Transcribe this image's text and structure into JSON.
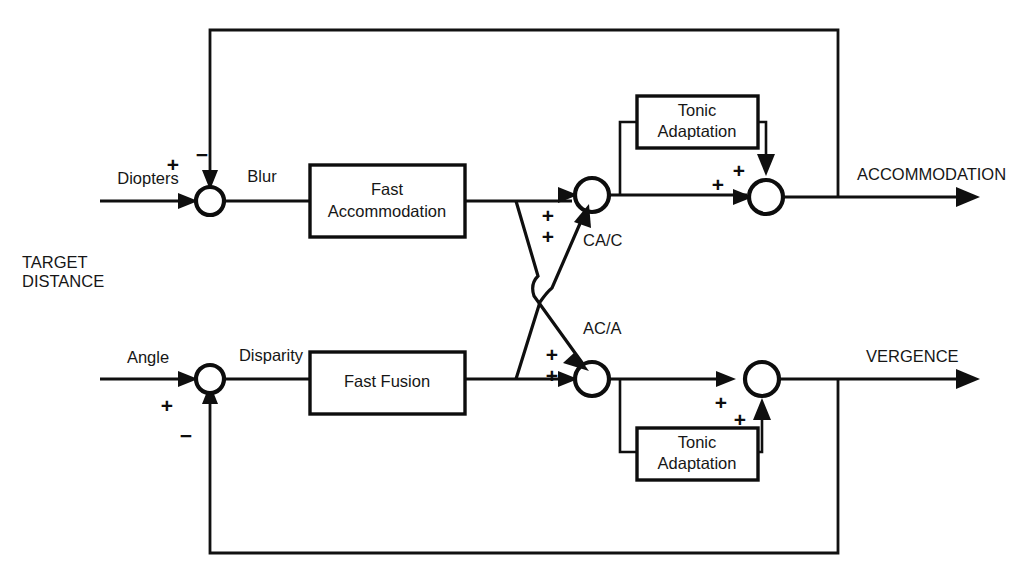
{
  "diagram": {
    "input_label_line1": "TARGET",
    "input_label_line2": "DISTANCE",
    "accommodation_branch": {
      "input_signal": "Diopters",
      "error_signal": "Blur",
      "plant_block": "Fast\nAccommodation",
      "plant_block_line1": "Fast",
      "plant_block_line2": "Accommodation",
      "tonic_block_line1": "Tonic",
      "tonic_block_line2": "Adaptation",
      "crosslink_label": "CA/C",
      "output_label": "ACCOMMODATION",
      "summing_input_sign": "+",
      "summing_feedback_sign": "−",
      "crosslink_sign_upper": "+",
      "crosslink_sign_lower": "+",
      "tonic_sum_sign_upper": "+",
      "tonic_sum_sign_lower": "+"
    },
    "vergence_branch": {
      "input_signal": "Angle",
      "error_signal": "Disparity",
      "plant_block": "Fast Fusion",
      "tonic_block_line1": "Tonic",
      "tonic_block_line2": "Adaptation",
      "crosslink_label": "AC/A",
      "output_label": "VERGENCE",
      "summing_input_sign": "+",
      "summing_feedback_sign": "−",
      "crosslink_sign_upper": "+",
      "crosslink_sign_lower": "+",
      "tonic_sum_sign_upper": "+",
      "tonic_sum_sign_lower": "+"
    },
    "colors": {
      "line": "#0f0f0f",
      "background": "#ffffff",
      "text": "#161616"
    }
  }
}
